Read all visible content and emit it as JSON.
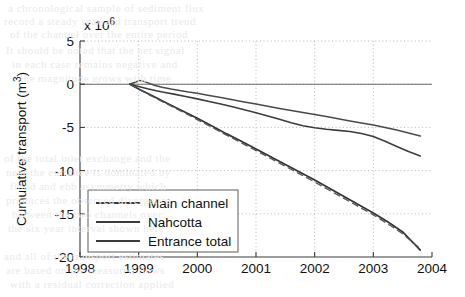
{
  "background_text": [
    {
      "text": "a chronological sample of sediment flux",
      "x": 8,
      "y": 2
    },
    {
      "text": "record a steady seaward transport trend",
      "x": 4,
      "y": 15
    },
    {
      "text": "of the channel over the entire period",
      "x": 10,
      "y": 28
    },
    {
      "text": "It should be noted that the net signal",
      "x": 6,
      "y": 44
    },
    {
      "text": "in each case remains negative and",
      "x": 12,
      "y": 58
    },
    {
      "text": "the magnitude grows with time",
      "x": 20,
      "y": 72
    },
    {
      "text": "of the total inlet exchange and the",
      "x": 4,
      "y": 152
    },
    {
      "text": "near the entrance is dominated by",
      "x": 6,
      "y": 166
    },
    {
      "text": "flood and ebb asymmetry which",
      "x": 10,
      "y": 180
    },
    {
      "text": "produces the observed divergence",
      "x": 6,
      "y": 194
    },
    {
      "text": "between the two channels over",
      "x": 12,
      "y": 208
    },
    {
      "text": "the six year interval shown here",
      "x": 8,
      "y": 222
    },
    {
      "text": "and all of the transport estimates",
      "x": 4,
      "y": 250
    },
    {
      "text": "are based on the measured flows",
      "x": 6,
      "y": 264
    },
    {
      "text": "with a residual correction applied",
      "x": 10,
      "y": 278
    }
  ],
  "chart_data": {
    "type": "line",
    "title": "",
    "xlabel": "",
    "ylabel": "Cumulative transport (m",
    "ylabel_sup": "3",
    "ylabel_tail": ")",
    "y_multiplier": "x 10",
    "y_multiplier_exp": "6",
    "xlim": [
      1998,
      2004
    ],
    "ylim": [
      -20,
      5
    ],
    "grid": true,
    "legend_position": "lower left",
    "x_ticks": [
      1998,
      1999,
      2000,
      2001,
      2002,
      2003,
      2004
    ],
    "x_tick_labels": [
      "1998",
      "1999",
      "2000",
      "2001",
      "2002",
      "2003",
      "2004"
    ],
    "y_ticks": [
      5,
      0,
      -5,
      -10,
      -15,
      -20
    ],
    "y_tick_labels": [
      "5",
      "0",
      "-5",
      "-10",
      "-15",
      "-20"
    ],
    "series": [
      {
        "name": "Main channel",
        "style": "solid",
        "color": "#4a4a4a",
        "x": [
          1998.85,
          1998.95,
          1999.02,
          1999.1,
          1999.18,
          1999.28,
          1999.4,
          1999.55,
          1999.7,
          1999.85,
          2000.0,
          2000.2,
          2000.4,
          2000.6,
          2000.8,
          2001.0,
          2001.2,
          2001.4,
          2001.6,
          2001.8,
          2002.0,
          2002.2,
          2002.4,
          2002.6,
          2002.8,
          2003.0,
          2003.2,
          2003.4,
          2003.6,
          2003.8
        ],
        "y": [
          0.0,
          0.25,
          0.42,
          0.3,
          0.1,
          -0.15,
          -0.35,
          -0.55,
          -0.72,
          -0.9,
          -1.05,
          -1.3,
          -1.55,
          -1.8,
          -2.05,
          -2.3,
          -2.55,
          -2.8,
          -3.05,
          -3.28,
          -3.5,
          -3.75,
          -4.0,
          -4.25,
          -4.5,
          -4.72,
          -5.0,
          -5.3,
          -5.65,
          -6.0
        ]
      },
      {
        "name": "Nahcotta",
        "style": "solid",
        "color": "#3d3d3d",
        "x": [
          1998.85,
          1998.95,
          1999.05,
          1999.15,
          1999.3,
          1999.45,
          1999.6,
          1999.8,
          2000.0,
          2000.2,
          2000.4,
          2000.6,
          2000.8,
          2001.0,
          2001.2,
          2001.4,
          2001.5,
          2001.6,
          2001.8,
          2002.0,
          2002.2,
          2002.4,
          2002.6,
          2002.8,
          2003.0,
          2003.2,
          2003.4,
          2003.6,
          2003.8
        ],
        "y": [
          0.0,
          -0.18,
          -0.35,
          -0.52,
          -0.75,
          -0.95,
          -1.15,
          -1.42,
          -1.7,
          -2.0,
          -2.3,
          -2.62,
          -2.95,
          -3.3,
          -3.68,
          -4.05,
          -4.25,
          -4.45,
          -4.8,
          -5.05,
          -5.22,
          -5.35,
          -5.48,
          -5.7,
          -6.05,
          -6.6,
          -7.2,
          -7.8,
          -8.3
        ]
      },
      {
        "name": "Entrance total",
        "style": "solid",
        "color": "#333333",
        "x": [
          1998.85,
          1999.0,
          1999.25,
          1999.5,
          1999.75,
          2000.0,
          2000.25,
          2000.5,
          2000.75,
          2001.0,
          2001.25,
          2001.5,
          2001.75,
          2002.0,
          2002.25,
          2002.5,
          2002.75,
          2003.0,
          2003.25,
          2003.5,
          2003.8
        ],
        "y": [
          0.0,
          -0.55,
          -1.4,
          -2.25,
          -3.1,
          -3.95,
          -4.85,
          -5.75,
          -6.6,
          -7.5,
          -8.4,
          -9.3,
          -10.2,
          -11.1,
          -12.05,
          -13.0,
          -13.95,
          -14.9,
          -15.95,
          -17.1,
          -19.2
        ]
      },
      {
        "name": "Entrance total (alt)",
        "style": "dashed",
        "color": "#555555",
        "x": [
          1998.85,
          1999.0,
          1999.25,
          1999.5,
          1999.75,
          2000.0,
          2000.25,
          2000.5,
          2000.75,
          2001.0,
          2001.25,
          2001.5,
          2001.75,
          2002.0,
          2002.25,
          2002.5,
          2002.75,
          2003.0,
          2003.25,
          2003.5,
          2003.8
        ],
        "y": [
          0.0,
          -0.6,
          -1.48,
          -2.35,
          -3.22,
          -4.1,
          -5.0,
          -5.9,
          -6.78,
          -7.68,
          -8.58,
          -9.5,
          -10.4,
          -11.32,
          -12.28,
          -13.22,
          -14.18,
          -15.12,
          -16.18,
          -17.3,
          -19.05
        ]
      }
    ],
    "legend_entries": [
      "Main channel",
      "Nahcotta",
      "Entrance total"
    ]
  }
}
